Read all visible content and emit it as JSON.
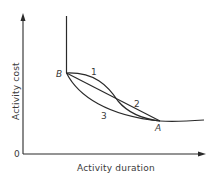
{
  "diagram": {
    "axes": {
      "x_label": "Activity duration",
      "y_label": "Activity cost",
      "origin_label": "0"
    },
    "points": {
      "B": "B",
      "A": "A"
    },
    "curves": [
      {
        "id": "1",
        "label": "1",
        "description": "concave curve from B to A, bowing above the straight line"
      },
      {
        "id": "2",
        "label": "2",
        "description": "straight line from B to A"
      },
      {
        "id": "3",
        "label": "3",
        "description": "convex curve from B to A, bowing below the straight line"
      }
    ],
    "extra_segments": [
      "vertical line rising from point B",
      "flat curve continuing right of point A"
    ],
    "colors": {
      "line": "#2a2a2a",
      "text": "#3a3a3a",
      "background": "#ffffff"
    }
  }
}
